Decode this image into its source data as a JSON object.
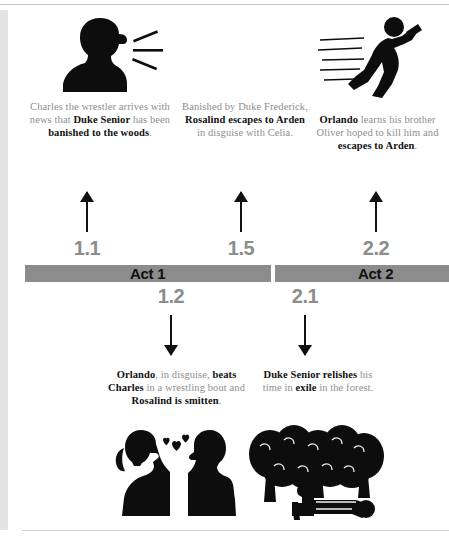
{
  "colors": {
    "bar_gray": "#8c8c8c",
    "caption_gray": "#8e8e8e",
    "bold_text": "#111111",
    "rule_gray": "#c9c9c9",
    "strip_gray": "#e3e3e3"
  },
  "acts": [
    {
      "label": "Act 1"
    },
    {
      "label": "Act 2"
    }
  ],
  "scenes": {
    "s11": "1.1",
    "s15": "1.5",
    "s22": "2.2",
    "s12": "1.2",
    "s21": "2.1"
  },
  "events": {
    "charles": {
      "scene": "1.1",
      "icon": "shouting-person-icon",
      "caption_runs": [
        {
          "text": "Charles the wrestler arrives with news that ",
          "bold": false
        },
        {
          "text": "Duke Senior",
          "bold": true
        },
        {
          "text": " has been ",
          "bold": false
        },
        {
          "text": "banished to the woods",
          "bold": true
        },
        {
          "text": ".",
          "bold": false
        }
      ]
    },
    "rosalind": {
      "scene": "1.5",
      "icon": null,
      "caption_runs": [
        {
          "text": "Banished by Duke Frederick, ",
          "bold": false
        },
        {
          "text": "Rosalind escapes to Arden",
          "bold": true
        },
        {
          "text": " in disguise with Celia.",
          "bold": false
        }
      ]
    },
    "orlando_flees": {
      "scene": "2.2",
      "icon": "running-person-icon",
      "caption_runs": [
        {
          "text": "Orlando",
          "bold": true
        },
        {
          "text": " learns his brother Oliver hoped to kill him and ",
          "bold": false
        },
        {
          "text": "escapes to Arden",
          "bold": true
        },
        {
          "text": ".",
          "bold": false
        }
      ]
    },
    "wrestling": {
      "scene": "1.2",
      "icon": "two-people-hearts-icon",
      "caption_runs": [
        {
          "text": "Orlando",
          "bold": true
        },
        {
          "text": ", in disguise, ",
          "bold": false
        },
        {
          "text": "beats Charles",
          "bold": true
        },
        {
          "text": " in a wrestling bout and ",
          "bold": false
        },
        {
          "text": "Rosalind is smitten",
          "bold": true
        },
        {
          "text": ".",
          "bold": false
        }
      ]
    },
    "exile": {
      "scene": "2.1",
      "icon": "forest-person-resting-icon",
      "caption_runs": [
        {
          "text": "Duke Senior relishes",
          "bold": true
        },
        {
          "text": " his time in ",
          "bold": false
        },
        {
          "text": "exile",
          "bold": true
        },
        {
          "text": " in the forest.",
          "bold": false
        }
      ]
    }
  }
}
